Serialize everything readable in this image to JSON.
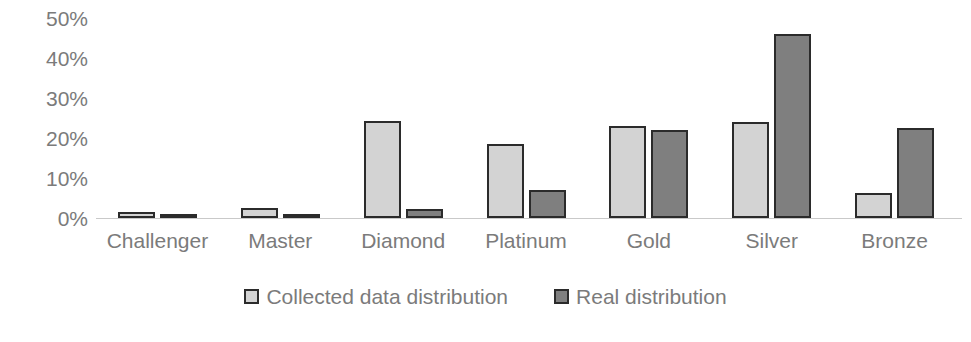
{
  "chart_data": {
    "type": "bar",
    "title": "",
    "subtitle": "",
    "xlabel": "",
    "ylabel": "",
    "categories": [
      "Challenger",
      "Master",
      "Diamond",
      "Platinum",
      "Gold",
      "Silver",
      "Bronze"
    ],
    "series": [
      {
        "name": "Collected data distribution",
        "color": "#d3d3d3",
        "values": [
          1.5,
          2.6,
          24.2,
          18.5,
          23.1,
          24.1,
          6.3
        ]
      },
      {
        "name": "Real distribution",
        "color": "#7f7f7f",
        "values": [
          0.3,
          0.3,
          2.2,
          7.0,
          22.0,
          46.0,
          22.5
        ]
      }
    ],
    "ylim": [
      0,
      50
    ],
    "ytick_values": [
      50,
      40,
      30,
      20,
      10,
      0
    ],
    "ytick_labels": [
      "50%",
      "40%",
      "30%",
      "20%",
      "10%",
      "0%"
    ],
    "grid": false,
    "legend_position": "bottom",
    "axis_line_color": "#c9c9c9",
    "text_color": "#7b7b7b",
    "bar_border_color": "#2b2b2b"
  }
}
